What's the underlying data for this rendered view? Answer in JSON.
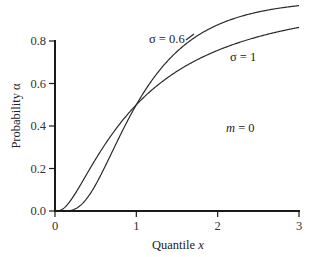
{
  "chart_data": {
    "type": "line",
    "title": "",
    "xlabel": "Quantile",
    "xlabel_var": "x",
    "ylabel": "Probability α",
    "xlim": [
      0,
      3
    ],
    "ylim": [
      0,
      0.8
    ],
    "xticks": [
      0,
      1,
      2,
      3
    ],
    "xtick_labels": [
      "0",
      "1",
      "2",
      "3"
    ],
    "yticks": [
      0.0,
      0.2,
      0.4,
      0.6,
      0.8
    ],
    "ytick_labels": [
      "0.0",
      "0.2",
      "0.4",
      "0.6",
      "0.8"
    ],
    "grid": false,
    "legend": "none",
    "series": [
      {
        "name": "σ = 0.6",
        "label": "σ = 0.6",
        "m": 0,
        "sigma": 0.6,
        "x": [
          0.1,
          0.2,
          0.3,
          0.4,
          0.5,
          0.6,
          0.7,
          0.8,
          0.9,
          1.0,
          1.25,
          1.5,
          1.75,
          2.0,
          2.25,
          2.5,
          2.75,
          3.0
        ],
        "y": [
          0.0001,
          0.004,
          0.022,
          0.064,
          0.124,
          0.196,
          0.276,
          0.356,
          0.43,
          0.5,
          0.644,
          0.751,
          0.824,
          0.876,
          0.911,
          0.936,
          0.954,
          0.966
        ]
      },
      {
        "name": "σ = 1",
        "label": "σ = 1",
        "m": 0,
        "sigma": 1,
        "x": [
          0.1,
          0.2,
          0.3,
          0.4,
          0.5,
          0.6,
          0.7,
          0.8,
          0.9,
          1.0,
          1.25,
          1.5,
          1.75,
          2.0,
          2.25,
          2.5,
          2.75,
          3.0
        ],
        "y": [
          0.011,
          0.054,
          0.114,
          0.18,
          0.244,
          0.305,
          0.361,
          0.412,
          0.458,
          0.5,
          0.588,
          0.658,
          0.713,
          0.756,
          0.792,
          0.82,
          0.844,
          0.864
        ]
      }
    ],
    "annotations": [
      {
        "text": "m = 0",
        "var": "m",
        "rest": " = 0"
      }
    ]
  }
}
